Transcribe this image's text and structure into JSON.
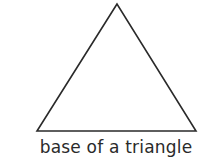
{
  "diagram": {
    "shape": "triangle",
    "vertices": [
      [
        117,
        4
      ],
      [
        37,
        131
      ],
      [
        196,
        131
      ]
    ],
    "stroke_color": "#2a2a2a",
    "caption": "base of a triangle"
  }
}
